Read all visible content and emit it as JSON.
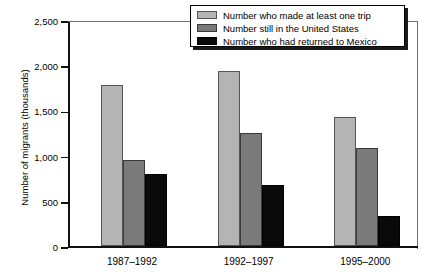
{
  "chart_data": {
    "type": "bar",
    "title": "",
    "xlabel": "",
    "ylabel": "Number of migrants (thousands)",
    "categories": [
      "1987–1992",
      "1992–1997",
      "1995–2000"
    ],
    "series": [
      {
        "name": "Number who made at least one trip",
        "color": "#b4b4b4",
        "values": [
          1780,
          1940,
          1430
        ]
      },
      {
        "name": "Number still in the United States",
        "color": "#7a7a7a",
        "values": [
          950,
          1250,
          1080
        ]
      },
      {
        "name": "Number who had returned to Mexico",
        "color": "#0a0a0a",
        "values": [
          800,
          670,
          330
        ]
      }
    ],
    "ylim": [
      0,
      2500
    ],
    "ytick_values": [
      0,
      500,
      1000,
      1500,
      2000,
      2500
    ],
    "ytick_labels": [
      "0",
      "500",
      "1,000",
      "1,500",
      "2,000",
      "2,500"
    ],
    "grid": false,
    "legend_position": "top-right"
  }
}
